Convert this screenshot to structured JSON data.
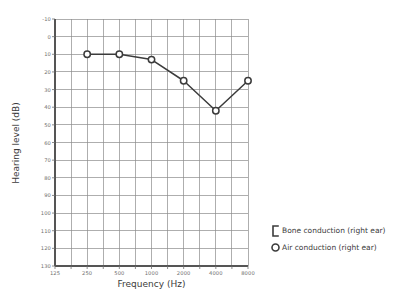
{
  "chart_data": {
    "type": "line",
    "title": "",
    "xlabel": "Frequency (Hz)",
    "ylabel": "Hearing level (dB)",
    "x_scale": "log",
    "x_ticks": [
      125,
      250,
      500,
      1000,
      2000,
      4000,
      8000
    ],
    "x_tick_labels": [
      "125",
      "250",
      "500",
      "1000",
      "2000",
      "4000",
      "8000"
    ],
    "xlim": [
      125,
      8000
    ],
    "y_ticks": [
      -10,
      0,
      10,
      20,
      30,
      40,
      50,
      60,
      70,
      80,
      90,
      100,
      110,
      120,
      130
    ],
    "y_tick_labels": [
      "-10",
      "0",
      "10",
      "20",
      "30",
      "40",
      "50",
      "60",
      "70",
      "80",
      "90",
      "100",
      "110",
      "120",
      "130"
    ],
    "ylim": [
      -10,
      130
    ],
    "y_inverted": true,
    "grid": true,
    "legend_position": "right-outside",
    "series": [
      {
        "name": "Air conduction (right ear)",
        "marker": "circle",
        "color": "#3b3b3b",
        "x": [
          250,
          500,
          1000,
          2000,
          4000,
          8000
        ],
        "values": [
          10,
          10,
          13,
          25,
          42,
          25
        ]
      }
    ],
    "legend": [
      {
        "marker": "bracket",
        "label": "Bone conduction (right ear)"
      },
      {
        "marker": "circle",
        "label": "Air conduction (right ear)"
      }
    ]
  },
  "colors": {
    "line": "#3b3b3b",
    "grid": "#8c8c8c",
    "axis": "#6e6e6e",
    "text": "#3b3b3b",
    "background": "#ffffff"
  }
}
